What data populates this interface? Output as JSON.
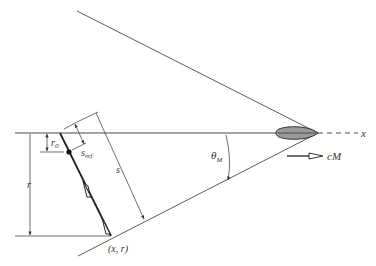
{
  "diagram": {
    "title": "",
    "labels": {
      "x_axis": "x",
      "r0": "r",
      "r0_sub": "0",
      "sref": "s",
      "sref_sub": "ref",
      "s": "s",
      "r": "r",
      "theta": "θ",
      "theta_sub": "M",
      "velocity": "cM",
      "point": "(x, r)"
    },
    "colors": {
      "line": "#4a4a4a",
      "body_fill": "#9a9a9a",
      "text": "#333333"
    }
  }
}
